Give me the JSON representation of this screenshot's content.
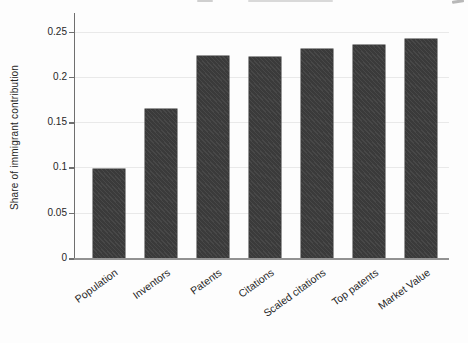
{
  "chart_data": {
    "type": "bar",
    "title": "",
    "xlabel": "",
    "ylabel": "Share of immigrant contribution",
    "categories": [
      "Population",
      "Inventors",
      "Patents",
      "Citations",
      "Scaled citations",
      "Top patents",
      "Market Value"
    ],
    "values": [
      0.098,
      0.164,
      0.223,
      0.222,
      0.231,
      0.235,
      0.242
    ],
    "ylim": [
      0,
      0.25
    ],
    "yticks": [
      0,
      0.05,
      0.1,
      0.15,
      0.2,
      0.25
    ],
    "ytick_labels": [
      "0",
      "0.05",
      "0.1",
      "0.15",
      "0.2",
      "0.25"
    ],
    "grid": "horizontal-faint",
    "legend_position": "none",
    "bar_color": "#3e3e3e",
    "axis_color": "#6f6f6f",
    "grid_color": "#e9e9e9",
    "text_color": "#262626",
    "background_color": "#fdfdfd"
  }
}
